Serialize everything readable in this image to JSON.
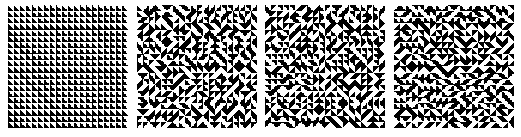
{
  "figure": {
    "grid_size": 20,
    "panels": [
      {
        "name": "panel-uniform",
        "left": 8,
        "mode": "uniform",
        "orientation": 0,
        "seed": 0
      },
      {
        "name": "panel-random-1",
        "left": 137,
        "mode": "random",
        "seed": 11
      },
      {
        "name": "panel-random-2",
        "left": 265,
        "mode": "random",
        "seed": 29
      },
      {
        "name": "panel-random-3",
        "left": 394,
        "mode": "random",
        "seed": 53
      }
    ],
    "colors": {
      "fill": "#000000",
      "background": "#ffffff"
    }
  }
}
